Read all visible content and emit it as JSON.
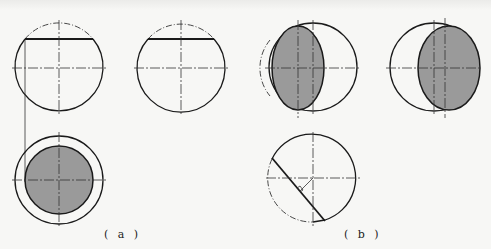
{
  "figure": {
    "panel_a": {
      "label": "( a )",
      "views": [
        {
          "name": "front-view",
          "shape": "circle",
          "cut_line": "horizontal chord near top"
        },
        {
          "name": "top-view",
          "shape": "circle",
          "cut_line": "horizontal chord near top"
        },
        {
          "name": "section-view",
          "shape": "concentric circles",
          "fill": "inner circle shaded"
        }
      ]
    },
    "panel_b": {
      "label": "( b )",
      "views": [
        {
          "name": "left-ellipse-view",
          "shape": "circle with shaded ellipse (left)"
        },
        {
          "name": "right-ellipse-view",
          "shape": "circle with shaded ellipse (right)"
        },
        {
          "name": "inclined-cut-view",
          "shape": "circle with inclined chord and right-angle mark"
        }
      ]
    },
    "colors": {
      "line": "#1a1a1a",
      "fill": "#9a9a9a",
      "background": "#f7f7f5"
    }
  }
}
